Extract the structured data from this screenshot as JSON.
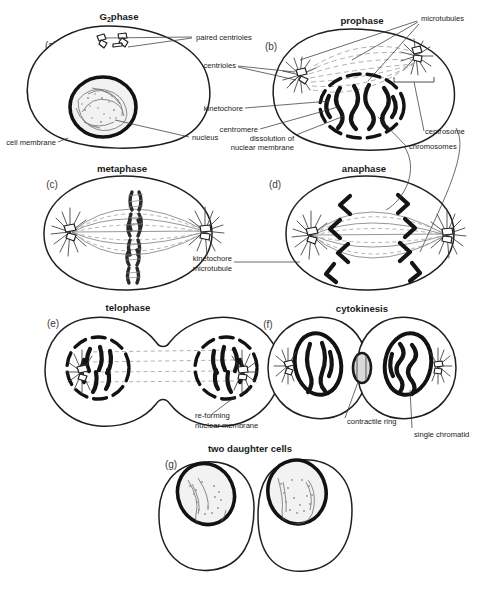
{
  "figure": {
    "title_alt": "Stages of mitosis and cytokinesis",
    "background_color": "#ffffff",
    "ink_color": "#1a1a1a",
    "width": 491,
    "height": 592
  },
  "panels": [
    {
      "id": "a",
      "letter": "(a)",
      "title": "G",
      "title_subscript": "2",
      "title_suffix": "phase",
      "title_full": "G2phase"
    },
    {
      "id": "b",
      "letter": "(b)",
      "title": "prophase"
    },
    {
      "id": "c",
      "letter": "(c)",
      "title": "metaphase"
    },
    {
      "id": "d",
      "letter": "(d)",
      "title": "anaphase"
    },
    {
      "id": "e",
      "letter": "(e)",
      "title": "telophase"
    },
    {
      "id": "f",
      "letter": "(f)",
      "title": "cytokinesis"
    },
    {
      "id": "g",
      "letter": "(g)",
      "title": "two daughter cells"
    }
  ],
  "labels": {
    "paired_centrioles": "paired centrioles",
    "centrioles": "centrioles",
    "kinetochore": "kinetochore",
    "centromere": "centromere",
    "dissolution_line1": "dissolution of",
    "dissolution_line2": "nuclear membrane",
    "cell_membrane": "cell membrane",
    "nucleus": "nucleus",
    "microtubules": "microtubules",
    "centrosome": "centrosome",
    "chromosomes": "chromosomes",
    "kinetochore_mt_line1": "kinetochore",
    "kinetochore_mt_line2": "microtubule",
    "reforming_line1": "re-forming",
    "reforming_line2": "nuclear membrane",
    "contractile_ring": "contractile ring",
    "single_chromatid": "single chromatid"
  }
}
